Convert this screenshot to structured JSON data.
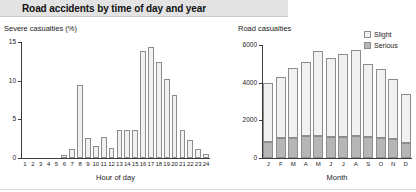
{
  "header": {
    "title": "Road accidents by time of day and year"
  },
  "colors": {
    "banner_bg": "#e3e3e3",
    "slight": "#f1f1f1",
    "serious": "#b6b6b6",
    "bar_outline": "#8d8d8d",
    "axis": "#3a3a3a"
  },
  "chart_data": [
    {
      "type": "bar",
      "id": "severe-casualties-by-hour",
      "title": "Severe casualties (%)",
      "xlabel": "Hour of day",
      "ylabel": "Severe casualties (%)",
      "ylim": [
        0,
        15
      ],
      "yticks": [
        0,
        5,
        10,
        15
      ],
      "ytick_labels": [
        "0",
        "5",
        "10",
        "15"
      ],
      "grid": false,
      "legend": "none",
      "categories": [
        "1",
        "2",
        "3",
        "4",
        "5",
        "6",
        "7",
        "8",
        "9",
        "10",
        "11",
        "12",
        "13",
        "14",
        "15",
        "16",
        "17",
        "18",
        "19",
        "20",
        "21",
        "22",
        "23",
        "24"
      ],
      "values": [
        0,
        0,
        0,
        0,
        0,
        0.4,
        1.2,
        9.4,
        2.6,
        1.6,
        2.7,
        1.3,
        3.6,
        3.6,
        3.6,
        13.9,
        14.4,
        12.4,
        10.2,
        8.1,
        3.6,
        2.3,
        1.2,
        0.5
      ]
    },
    {
      "type": "bar",
      "id": "road-casualties-by-month",
      "title": "Road casualties",
      "xlabel": "Month",
      "ylabel": "Road casualties",
      "ylim": [
        0,
        6000
      ],
      "yticks": [
        0,
        2000,
        4000,
        6000
      ],
      "ytick_labels": [
        "0",
        "2000",
        "4000",
        "6000"
      ],
      "grid": false,
      "legend": "top-right",
      "stacked": true,
      "categories": [
        "J",
        "F",
        "M",
        "A",
        "M",
        "J",
        "J",
        "A",
        "S",
        "O",
        "N",
        "D"
      ],
      "series": [
        {
          "name": "Serious",
          "values": [
            830,
            1050,
            1080,
            1150,
            1160,
            1140,
            1140,
            1150,
            1130,
            1060,
            1000,
            780
          ]
        },
        {
          "name": "Slight",
          "values": [
            3170,
            3250,
            3720,
            3950,
            4500,
            4180,
            4400,
            4580,
            3870,
            3660,
            3200,
            2620
          ]
        }
      ],
      "totals": [
        4000,
        4300,
        4800,
        5100,
        5660,
        5320,
        5540,
        5730,
        5000,
        4720,
        4200,
        3400
      ]
    }
  ]
}
